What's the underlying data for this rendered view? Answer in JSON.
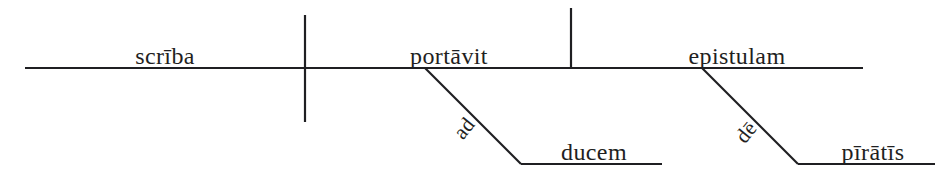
{
  "diagram": {
    "type": "reed-kellogg-sentence-diagram",
    "language": "Latin",
    "sentence": "Scrība portāvit epistulam ad ducem dē pīrātīs.",
    "baseline": {
      "x1": 25,
      "x2": 863,
      "y": 68
    },
    "dividers": [
      {
        "name": "subject-verb-divider",
        "x": 305,
        "y1": 15,
        "y2": 122,
        "crosses_baseline": true
      },
      {
        "name": "verb-object-divider",
        "x": 571,
        "y1": 8,
        "y2": 68,
        "crosses_baseline": false
      }
    ],
    "words": [
      {
        "id": "subject",
        "text": "scrība",
        "role": "subject",
        "slot": "baseline",
        "cx": 165,
        "baseline_y": 68
      },
      {
        "id": "verb",
        "text": "portāvit",
        "role": "verb",
        "slot": "baseline",
        "cx": 449,
        "baseline_y": 68
      },
      {
        "id": "object",
        "text": "epistulam",
        "role": "direct-object",
        "slot": "baseline",
        "cx": 737,
        "baseline_y": 68
      },
      {
        "id": "prep-ad",
        "text": "ad",
        "role": "preposition",
        "slot": "diagonal",
        "x": 466,
        "y": 122,
        "rotation": -51
      },
      {
        "id": "obj-ad",
        "text": "ducem",
        "role": "object-of-preposition",
        "slot": "branch-baseline",
        "cx": 594,
        "baseline_y": 164
      },
      {
        "id": "prep-de",
        "text": "dē",
        "role": "preposition",
        "slot": "diagonal",
        "x": 748,
        "y": 126,
        "rotation": -51
      },
      {
        "id": "obj-de",
        "text": "pīrātīs",
        "role": "object-of-preposition",
        "slot": "branch-baseline",
        "cx": 873,
        "baseline_y": 164
      }
    ],
    "prepositional_phrases": [
      {
        "id": "pp-ad",
        "preposition": "ad",
        "object": "ducem",
        "diagonal": {
          "x1": 425,
          "y1": 68,
          "x2": 521,
          "y2": 164
        },
        "branch": {
          "x1": 521,
          "x2": 662,
          "y": 164
        }
      },
      {
        "id": "pp-de",
        "preposition": "dē",
        "object": "pīrātīs",
        "diagonal": {
          "x1": 702,
          "y1": 68,
          "x2": 798,
          "y2": 164
        },
        "branch": {
          "x1": 798,
          "x2": 935,
          "y": 164
        }
      }
    ],
    "style": {
      "background": "#ffffff",
      "ink": "#1f1f22",
      "stroke_width": 2.2
    }
  }
}
